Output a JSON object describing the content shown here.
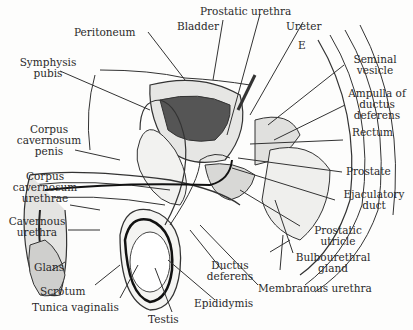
{
  "figure": {
    "type": "anatomical sagittal section",
    "labels": {
      "peritoneum": "Peritoneum",
      "prostatic_urethra": "Prostatic urethra",
      "bladder": "Bladder",
      "ureter": "Ureter",
      "symphysis_pubis_1": "Symphysis",
      "symphysis_pubis_2": "pubis",
      "seminal_vesicle_1": "Seminal",
      "seminal_vesicle_2": "vesicle",
      "ampulla_1": "Ampulla of",
      "ampulla_2": "ductus",
      "ampulla_3": "deferens",
      "rectum": "Rectum",
      "cc_penis_1": "Corpus",
      "cc_penis_2": "cavernosum",
      "cc_penis_3": "penis",
      "prostate": "Prostate",
      "cc_urethrae_1": "Corpus",
      "cc_urethrae_2": "cavernosum",
      "cc_urethrae_3": "urethrae",
      "ejaculatory_1": "Ejaculatory",
      "ejaculatory_2": "duct",
      "cavernous_urethra_1": "Cavernous",
      "cavernous_urethra_2": "urethra",
      "prostatic_utricle_1": "Prostatic",
      "prostatic_utricle_2": "utricle",
      "bulbourethral_1": "Bulbourethral",
      "bulbourethral_2": "gland",
      "glans": "Glans",
      "ductus_deferens_1": "Ductus",
      "ductus_deferens_2": "deferens",
      "scrotum": "Scrotum",
      "membranous_urethra": "Membranous urethra",
      "tunica_vaginalis": "Tunica vaginalis",
      "epididymis": "Epididymis",
      "testis": "Testis",
      "vertebra_mark": "E"
    }
  }
}
